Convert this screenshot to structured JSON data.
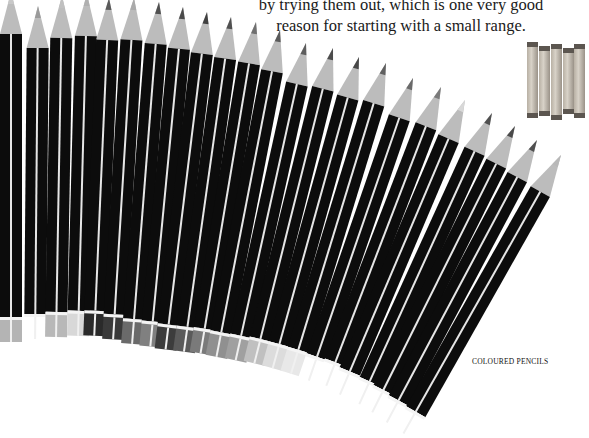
{
  "caption": {
    "line1": "by trying them out, which is one very good",
    "line2": "reason for starting with a small range."
  },
  "section_label": "COLOURED PENCILS",
  "colors": {
    "pencil_body": "#0c0c0c",
    "stripe": "#e6e6e6",
    "wood": "#bcbcbc",
    "background": "#ffffff"
  },
  "pencils": [
    {
      "x": 11,
      "y": -8,
      "angle": 0,
      "len": 350,
      "lead": "#c8c8c8",
      "cap": "#b4b4b4"
    },
    {
      "x": 38,
      "y": 6,
      "angle": 0.5,
      "len": 333,
      "lead": "#9a9a9a",
      "cap": "#ffffff"
    },
    {
      "x": 62,
      "y": -4,
      "angle": 1,
      "len": 341,
      "lead": "#c0c0c0",
      "cap": "#b8b8b8"
    },
    {
      "x": 87,
      "y": -6,
      "angle": 1.5,
      "len": 342,
      "lead": "#b0b0b0",
      "cap": "#d8d8d8"
    },
    {
      "x": 109,
      "y": -2,
      "angle": 2.5,
      "len": 338,
      "lead": "#5a5a5a",
      "cap": "#2a2a2a"
    },
    {
      "x": 134,
      "y": -2,
      "angle": 3.5,
      "len": 342,
      "lead": "#aaaaaa",
      "cap": "#3a3a3a"
    },
    {
      "x": 159,
      "y": 2,
      "angle": 4.5,
      "len": 343,
      "lead": "#505050",
      "cap": "#6a6a6a"
    },
    {
      "x": 183,
      "y": 7,
      "angle": 5.5,
      "len": 341,
      "lead": "#4a4a4a",
      "cap": "#808080"
    },
    {
      "x": 207,
      "y": 12,
      "angle": 7,
      "len": 340,
      "lead": "#404040",
      "cap": "#3c3c3c"
    },
    {
      "x": 231,
      "y": 17,
      "angle": 8,
      "len": 338,
      "lead": "#505050",
      "cap": "#5a5a5a"
    },
    {
      "x": 256,
      "y": 22,
      "angle": 9.5,
      "len": 336,
      "lead": "#707070",
      "cap": "#7a7a7a"
    },
    {
      "x": 280,
      "y": 30,
      "angle": 11,
      "len": 333,
      "lead": "#5a5a5a",
      "cap": "#909090"
    },
    {
      "x": 306,
      "y": 43,
      "angle": 12.5,
      "len": 325,
      "lead": "#5e5e5e",
      "cap": "#a0a0a0"
    },
    {
      "x": 333,
      "y": 48,
      "angle": 14,
      "len": 325,
      "lead": "#4c4c4c",
      "cap": "#c0c0c0"
    },
    {
      "x": 359,
      "y": 57,
      "angle": 15.5,
      "len": 323,
      "lead": "#484848",
      "cap": "#dcdcdc"
    },
    {
      "x": 386,
      "y": 63,
      "angle": 17,
      "len": 325,
      "lead": "#606060",
      "cap": "#e8e8e8"
    },
    {
      "x": 413,
      "y": 78,
      "angle": 19,
      "len": 320,
      "lead": "#6a6a6a",
      "cap": "#ffffff"
    },
    {
      "x": 441,
      "y": 87,
      "angle": 21,
      "len": 320,
      "lead": "#7a7a7a",
      "cap": "#ffffff"
    },
    {
      "x": 465,
      "y": 100,
      "angle": 23,
      "len": 320,
      "lead": "#d8d8d8",
      "cap": "#ffffff"
    },
    {
      "x": 492,
      "y": 113,
      "angle": 24.5,
      "len": 320,
      "lead": "#505050",
      "cap": "#ffffff"
    },
    {
      "x": 515,
      "y": 126,
      "angle": 26.5,
      "len": 320,
      "lead": "#4a4a4a",
      "cap": "#ffffff"
    },
    {
      "x": 537,
      "y": 140,
      "angle": 28,
      "len": 320,
      "lead": "#505050",
      "cap": "#ffffff"
    },
    {
      "x": 561,
      "y": 155,
      "angle": 29.5,
      "len": 320,
      "lead": "#b8b8b8",
      "cap": "#ffffff"
    }
  ],
  "chalks": [
    {
      "x": 0,
      "top": 0,
      "h": 76
    },
    {
      "x": 12,
      "top": 4,
      "h": 70
    },
    {
      "x": 24,
      "top": 2,
      "h": 76
    },
    {
      "x": 36,
      "top": 6,
      "h": 66
    },
    {
      "x": 47,
      "top": 2,
      "h": 74
    }
  ]
}
